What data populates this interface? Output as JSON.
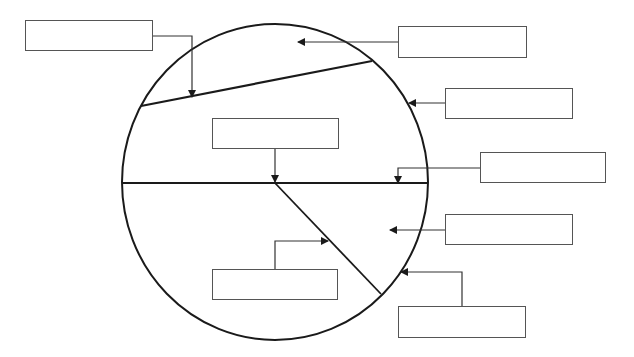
{
  "diagram": {
    "type": "circle-labeling-worksheet",
    "stroke_color": "#1a1a1a",
    "box_border_color": "#555555",
    "background": "#ffffff",
    "circle": {
      "cx": 275,
      "cy": 182,
      "rx": 153,
      "ry": 158
    },
    "lines": {
      "chord": {
        "x1": 141,
        "y1": 106,
        "x2": 372,
        "y2": 61
      },
      "diameter": {
        "x1": 123,
        "y1": 183,
        "x2": 428,
        "y2": 183
      },
      "radius_diagonal": {
        "x1": 275,
        "y1": 183,
        "x2": 381,
        "y2": 294
      }
    },
    "label_boxes": [
      {
        "id": "box-1",
        "label": "",
        "x": 25,
        "y": 20,
        "w": 128,
        "h": 31,
        "points_to": "chord"
      },
      {
        "id": "box-2",
        "label": "",
        "x": 398,
        "y": 26,
        "w": 129,
        "h": 32,
        "points_to": "segment-region"
      },
      {
        "id": "box-3",
        "label": "",
        "x": 445,
        "y": 88,
        "w": 128,
        "h": 31,
        "points_to": "circumference"
      },
      {
        "id": "box-4",
        "label": "",
        "x": 212,
        "y": 118,
        "w": 127,
        "h": 31,
        "points_to": "centre"
      },
      {
        "id": "box-5",
        "label": "",
        "x": 480,
        "y": 152,
        "w": 126,
        "h": 31,
        "points_to": "diameter"
      },
      {
        "id": "box-6",
        "label": "",
        "x": 445,
        "y": 214,
        "w": 128,
        "h": 31,
        "points_to": "sector-region"
      },
      {
        "id": "box-7",
        "label": "",
        "x": 212,
        "y": 269,
        "w": 126,
        "h": 31,
        "points_to": "radius"
      },
      {
        "id": "box-8",
        "label": "",
        "x": 398,
        "y": 306,
        "w": 128,
        "h": 32,
        "points_to": "arc"
      }
    ],
    "connectors": [
      {
        "from": "box-1",
        "points": "153,36 192,36 192,97"
      },
      {
        "from": "box-2",
        "points": "398,42 298,42"
      },
      {
        "from": "box-3",
        "points": "445,103 409,103"
      },
      {
        "from": "box-4",
        "points": "275,149 275,182"
      },
      {
        "from": "box-5",
        "points": "480,168 398,168 398,183"
      },
      {
        "from": "box-6",
        "points": "445,230 390,230"
      },
      {
        "from": "box-7",
        "points": "275,269 275,241 328,241"
      },
      {
        "from": "box-8",
        "points": "462,306 462,272 401,272"
      }
    ]
  }
}
